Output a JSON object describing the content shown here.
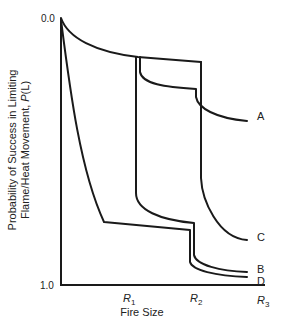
{
  "chart_data": {
    "type": "line",
    "title": "",
    "xlabel": "Fire Size",
    "ylabel_line1": "Probability of Success in Limiting",
    "ylabel_line2": "Flame/Heat Movement, P(L)",
    "ylabel": "Probability of Success in Limiting Flame/Heat Movement, P(L)",
    "y_ticks": [
      "0.0",
      "1.0"
    ],
    "y_axis_inverted": true,
    "ylim": [
      0.0,
      1.0
    ],
    "x_ticks": [
      {
        "base": "R",
        "sub": "1"
      },
      {
        "base": "R",
        "sub": "2"
      },
      {
        "base": "R",
        "sub": "3"
      }
    ],
    "x_tick_labels": [
      "R1",
      "R2",
      "R3"
    ],
    "grid": false,
    "legend_position": "inline-right",
    "series": [
      {
        "name": "A",
        "description": "Highest curve; step decreases near R1 and R2, ends lowest P(L) value",
        "points": [
          [
            0,
            0.0
          ],
          [
            0.95,
            0.15
          ],
          [
            1.0,
            0.22
          ],
          [
            1.9,
            0.27
          ],
          [
            1.95,
            0.31
          ],
          [
            2.7,
            0.39
          ]
        ]
      },
      {
        "name": "C",
        "description": "Follows top envelope until R2, then sharp drop",
        "points": [
          [
            0,
            0.0
          ],
          [
            0.95,
            0.15
          ],
          [
            2.0,
            0.16
          ],
          [
            2.0,
            0.62
          ],
          [
            2.7,
            0.83
          ]
        ]
      },
      {
        "name": "B",
        "description": "Follows top envelope until R1, sharp drop, second drop near R2",
        "points": [
          [
            0,
            0.0
          ],
          [
            0.95,
            0.15
          ],
          [
            0.95,
            0.67
          ],
          [
            1.9,
            0.77
          ],
          [
            1.9,
            0.88
          ],
          [
            2.7,
            0.95
          ]
        ]
      },
      {
        "name": "D",
        "description": "Drops steeply immediately, plateau, second drop near R2",
        "points": [
          [
            0,
            0.01
          ],
          [
            0.5,
            0.6
          ],
          [
            1.0,
            0.77
          ],
          [
            1.9,
            0.8
          ],
          [
            1.9,
            0.91
          ],
          [
            2.7,
            0.97
          ]
        ]
      }
    ]
  }
}
